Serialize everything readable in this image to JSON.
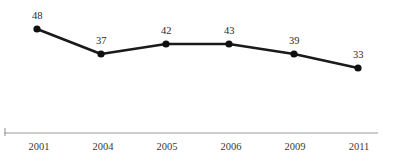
{
  "chart_data": {
    "type": "line",
    "title": "",
    "subtitle": "",
    "xlabel": "",
    "ylabel": "",
    "categories": [
      "2001",
      "2004",
      "2005",
      "2006",
      "2009",
      "2011"
    ],
    "values": [
      48,
      37,
      42,
      43,
      39,
      33
    ],
    "series": [
      {
        "name": "",
        "values": [
          48,
          37,
          42,
          43,
          39,
          33
        ]
      }
    ],
    "point_labels": [
      "48",
      "37",
      "42",
      "43",
      "39",
      "33"
    ],
    "tick_labels": [
      "2001",
      "2004",
      "2005",
      "2006",
      "2009",
      "2011"
    ],
    "legend": [],
    "legend_position": "none",
    "grid": false,
    "ylim": [
      0,
      55
    ],
    "marker": "circle",
    "line_color": "#1a1a1a",
    "marker_color": "#101010",
    "label_color": "#2a2a2c",
    "axis_color": "#9a9a9e",
    "background_color": "#ffffff",
    "points": [
      {
        "x": 37,
        "y": 29,
        "label": "48",
        "category": "2001",
        "value": 48,
        "label_x": 32,
        "label_y": 19
      },
      {
        "x": 101,
        "y": 54,
        "label": "37",
        "category": "2004",
        "value": 37,
        "label_x": 96,
        "label_y": 44
      },
      {
        "x": 166,
        "y": 44,
        "label": "42",
        "category": "2005",
        "value": 42,
        "label_x": 161,
        "label_y": 34
      },
      {
        "x": 229,
        "y": 44,
        "label": "43",
        "category": "2006",
        "value": 43,
        "label_x": 224,
        "label_y": 34
      },
      {
        "x": 294,
        "y": 54,
        "label": "39",
        "category": "2009",
        "value": 39,
        "label_x": 289,
        "label_y": 44
      },
      {
        "x": 358,
        "y": 68,
        "label": "33",
        "category": "2011",
        "value": 33,
        "label_x": 353,
        "label_y": 58
      }
    ],
    "axis": {
      "y": 133,
      "x_start": 4,
      "x_end": 378,
      "tick_x": 5,
      "tick_top": 128,
      "tick_bottom": 136
    },
    "tick_label_y": 150,
    "tick_label_positions": [
      39,
      103,
      167,
      231,
      295,
      359
    ]
  }
}
